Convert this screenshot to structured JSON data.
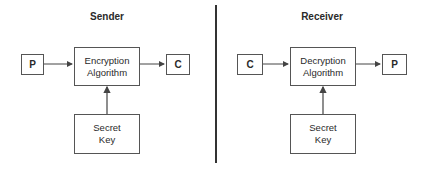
{
  "sender": {
    "title": "Sender",
    "input_label": "P",
    "algorithm_label": "Encryption Algorithm",
    "output_label": "C",
    "key_label_line1": "Secret",
    "key_label_line2": "Key"
  },
  "receiver": {
    "title": "Receiver",
    "input_label": "C",
    "algorithm_label": "Decryption Algorithm",
    "output_label": "P",
    "key_label_line1": "Secret",
    "key_label_line2": "Key"
  },
  "colors": {
    "line": "#444444",
    "divider": "#333333"
  }
}
